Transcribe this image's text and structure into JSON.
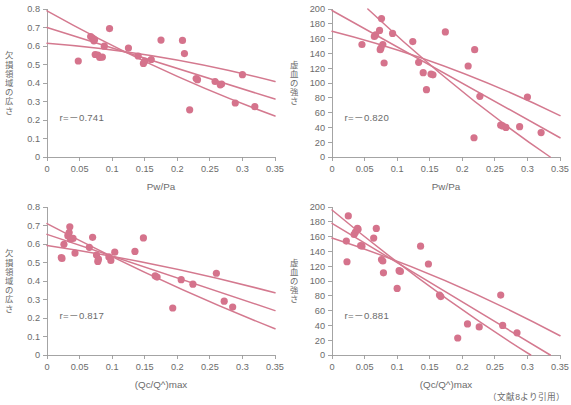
{
  "figure": {
    "source_note": "（文献8より引用）",
    "accent_color": "#d5738c",
    "line_color": "#d4798f",
    "axis_color": "#9a9a9a",
    "text_color": "#6b6b6b"
  },
  "chart_data": [
    {
      "id": "top-left",
      "type": "scatter",
      "title": "",
      "xlabel": "Pw/Pa",
      "ylabel": "欠損領域の広さ",
      "xlim": [
        0,
        0.35
      ],
      "ylim": [
        0,
        0.8
      ],
      "xticks": [
        0,
        0.05,
        0.1,
        0.15,
        0.2,
        0.25,
        0.3,
        0.35
      ],
      "xticklabels": [
        "0",
        "0.05",
        "0.1",
        "0.15",
        "0.2",
        "0.25",
        "0.3",
        "0.35"
      ],
      "yticks": [
        0,
        0.1,
        0.2,
        0.3,
        0.4,
        0.5,
        0.6,
        0.7,
        0.8
      ],
      "yticklabels": [
        "0",
        "0.1",
        "0.2",
        "0.3",
        "0.4",
        "0.5",
        "0.6",
        "0.7",
        "0.8"
      ],
      "grid": false,
      "annotation": "r=－0.741",
      "correlation": -0.741,
      "points": [
        [
          0.048,
          0.519
        ],
        [
          0.067,
          0.651
        ],
        [
          0.07,
          0.643
        ],
        [
          0.072,
          0.628
        ],
        [
          0.073,
          0.635
        ],
        [
          0.074,
          0.554
        ],
        [
          0.078,
          0.551
        ],
        [
          0.081,
          0.538
        ],
        [
          0.085,
          0.54
        ],
        [
          0.088,
          0.599
        ],
        [
          0.096,
          0.694
        ],
        [
          0.125,
          0.589
        ],
        [
          0.14,
          0.546
        ],
        [
          0.148,
          0.506
        ],
        [
          0.15,
          0.518
        ],
        [
          0.16,
          0.527
        ],
        [
          0.175,
          0.632
        ],
        [
          0.208,
          0.63
        ],
        [
          0.211,
          0.559
        ],
        [
          0.219,
          0.255
        ],
        [
          0.229,
          0.424
        ],
        [
          0.231,
          0.418
        ],
        [
          0.258,
          0.408
        ],
        [
          0.266,
          0.39
        ],
        [
          0.268,
          0.394
        ],
        [
          0.289,
          0.292
        ],
        [
          0.3,
          0.445
        ],
        [
          0.319,
          0.272
        ]
      ],
      "fit_lines": [
        {
          "name": "upper-band",
          "x": [
            0.0,
            0.35
          ],
          "y": [
            0.615,
            0.408
          ],
          "curve": 0.028
        },
        {
          "name": "regression",
          "x": [
            0.0,
            0.35
          ],
          "y": [
            0.7,
            0.313
          ],
          "curve": 0.0
        },
        {
          "name": "lower-band",
          "x": [
            0.0,
            0.35
          ],
          "y": [
            0.79,
            0.222
          ],
          "curve": -0.03
        }
      ]
    },
    {
      "id": "top-right",
      "type": "scatter",
      "title": "",
      "xlabel": "Pw/Pa",
      "ylabel": "虚血の強さ",
      "xlim": [
        0,
        0.35
      ],
      "ylim": [
        0,
        200
      ],
      "xticks": [
        0,
        0.05,
        0.1,
        0.15,
        0.2,
        0.25,
        0.3,
        0.35
      ],
      "xticklabels": [
        "0",
        "0.05",
        "0.1",
        "0.15",
        "0.2",
        "0.25",
        "0.3",
        "0.35"
      ],
      "yticks": [
        0,
        20,
        40,
        60,
        80,
        100,
        120,
        140,
        160,
        180,
        200
      ],
      "yticklabels": [
        "0",
        "20",
        "40",
        "60",
        "80",
        "100",
        "120",
        "140",
        "160",
        "180",
        "200"
      ],
      "grid": false,
      "annotation": "r=－0.820",
      "correlation": -0.82,
      "points": [
        [
          0.046,
          152
        ],
        [
          0.065,
          163
        ],
        [
          0.067,
          165
        ],
        [
          0.073,
          171
        ],
        [
          0.074,
          145
        ],
        [
          0.075,
          147
        ],
        [
          0.076,
          187
        ],
        [
          0.078,
          152
        ],
        [
          0.08,
          127
        ],
        [
          0.093,
          167
        ],
        [
          0.124,
          156
        ],
        [
          0.133,
          128
        ],
        [
          0.14,
          114
        ],
        [
          0.145,
          91
        ],
        [
          0.152,
          112
        ],
        [
          0.155,
          111
        ],
        [
          0.174,
          169
        ],
        [
          0.209,
          123
        ],
        [
          0.218,
          26
        ],
        [
          0.219,
          145
        ],
        [
          0.227,
          82
        ],
        [
          0.259,
          43
        ],
        [
          0.262,
          42
        ],
        [
          0.267,
          40
        ],
        [
          0.288,
          41
        ],
        [
          0.3,
          81
        ],
        [
          0.321,
          33
        ]
      ],
      "fit_lines": [
        {
          "name": "upper-band",
          "x": [
            0.0,
            0.35
          ],
          "y": [
            170,
            56
          ],
          "curve": 9
        },
        {
          "name": "regression",
          "x": [
            0.0,
            0.35
          ],
          "y": [
            198,
            26
          ],
          "curve": 0
        },
        {
          "name": "lower-band",
          "x": [
            0.055,
            0.335
          ],
          "y": [
            200,
            0
          ],
          "curve": -8
        }
      ]
    },
    {
      "id": "bottom-left",
      "type": "scatter",
      "title": "",
      "xlabel": "(Qc/Q^)max",
      "ylabel": "欠損領域の広さ",
      "xlim": [
        0,
        0.35
      ],
      "ylim": [
        0,
        0.8
      ],
      "xticks": [
        0,
        0.05,
        0.1,
        0.15,
        0.2,
        0.25,
        0.3,
        0.35
      ],
      "xticklabels": [
        "0",
        "0.05",
        "0.1",
        "0.15",
        "0.2",
        "0.25",
        "0.3",
        "0.35"
      ],
      "yticks": [
        0,
        0.1,
        0.2,
        0.3,
        0.4,
        0.5,
        0.6,
        0.7,
        0.8
      ],
      "yticklabels": [
        "0",
        "0.1",
        "0.2",
        "0.3",
        "0.4",
        "0.5",
        "0.6",
        "0.7",
        "0.8"
      ],
      "grid": false,
      "annotation": "r=－0.817",
      "correlation": -0.817,
      "points": [
        [
          0.022,
          0.527
        ],
        [
          0.023,
          0.522
        ],
        [
          0.026,
          0.598
        ],
        [
          0.032,
          0.645
        ],
        [
          0.034,
          0.662
        ],
        [
          0.035,
          0.693
        ],
        [
          0.036,
          0.627
        ],
        [
          0.04,
          0.63
        ],
        [
          0.043,
          0.551
        ],
        [
          0.065,
          0.582
        ],
        [
          0.07,
          0.636
        ],
        [
          0.076,
          0.54
        ],
        [
          0.078,
          0.506
        ],
        [
          0.079,
          0.518
        ],
        [
          0.095,
          0.53
        ],
        [
          0.098,
          0.511
        ],
        [
          0.104,
          0.556
        ],
        [
          0.135,
          0.56
        ],
        [
          0.148,
          0.633
        ],
        [
          0.166,
          0.428
        ],
        [
          0.169,
          0.421
        ],
        [
          0.193,
          0.254
        ],
        [
          0.206,
          0.407
        ],
        [
          0.224,
          0.383
        ],
        [
          0.26,
          0.442
        ],
        [
          0.272,
          0.291
        ],
        [
          0.285,
          0.259
        ]
      ],
      "fit_lines": [
        {
          "name": "upper-band",
          "x": [
            0.0,
            0.35
          ],
          "y": [
            0.592,
            0.336
          ],
          "curve": 0.018
        },
        {
          "name": "regression",
          "x": [
            0.0,
            0.35
          ],
          "y": [
            0.652,
            0.24
          ],
          "curve": 0.0
        },
        {
          "name": "lower-band",
          "x": [
            0.0,
            0.35
          ],
          "y": [
            0.71,
            0.142
          ],
          "curve": -0.02
        }
      ]
    },
    {
      "id": "bottom-right",
      "type": "scatter",
      "title": "",
      "xlabel": "(Qc/Q^)max",
      "ylabel": "虚血の強さ",
      "xlim": [
        0,
        0.35
      ],
      "ylim": [
        0,
        200
      ],
      "xticks": [
        0,
        0.05,
        0.1,
        0.15,
        0.2,
        0.25,
        0.3,
        0.35
      ],
      "xticklabels": [
        "0",
        "0.05",
        "0.1",
        "0.15",
        "0.2",
        "0.25",
        "0.3",
        "0.35"
      ],
      "yticks": [
        0,
        20,
        40,
        60,
        80,
        100,
        120,
        140,
        160,
        180,
        200
      ],
      "yticklabels": [
        "0",
        "20",
        "40",
        "60",
        "80",
        "100",
        "120",
        "140",
        "160",
        "180",
        "200"
      ],
      "grid": false,
      "annotation": "r=－0.881",
      "correlation": -0.881,
      "points": [
        [
          0.022,
          154
        ],
        [
          0.023,
          126
        ],
        [
          0.025,
          188
        ],
        [
          0.034,
          163
        ],
        [
          0.036,
          166
        ],
        [
          0.039,
          171
        ],
        [
          0.04,
          170
        ],
        [
          0.044,
          148
        ],
        [
          0.046,
          147
        ],
        [
          0.064,
          158
        ],
        [
          0.068,
          171
        ],
        [
          0.076,
          129
        ],
        [
          0.078,
          127
        ],
        [
          0.079,
          111
        ],
        [
          0.1,
          90
        ],
        [
          0.103,
          114
        ],
        [
          0.105,
          113
        ],
        [
          0.136,
          147
        ],
        [
          0.148,
          123
        ],
        [
          0.165,
          81
        ],
        [
          0.167,
          79
        ],
        [
          0.193,
          23
        ],
        [
          0.208,
          42
        ],
        [
          0.226,
          38
        ],
        [
          0.259,
          81
        ],
        [
          0.262,
          40
        ],
        [
          0.284,
          30
        ]
      ],
      "fit_lines": [
        {
          "name": "upper-band",
          "x": [
            0.0,
            0.35
          ],
          "y": [
            158,
            26
          ],
          "curve": 8
        },
        {
          "name": "regression",
          "x": [
            0.0,
            0.335
          ],
          "y": [
            178,
            0
          ],
          "curve": 0
        },
        {
          "name": "lower-band",
          "x": [
            0.0,
            0.305
          ],
          "y": [
            196,
            0
          ],
          "curve": -7
        }
      ]
    }
  ]
}
